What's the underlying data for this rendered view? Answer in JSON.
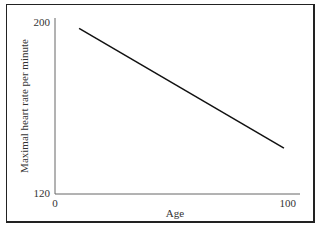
{
  "chart_data": {
    "type": "line",
    "title": "",
    "xlabel": "Age",
    "ylabel": "Maximal heart rate per minute",
    "xlim": [
      0,
      100
    ],
    "ylim": [
      120,
      200
    ],
    "x_ticks": [
      "0",
      "100"
    ],
    "y_ticks": [
      "120",
      "200"
    ],
    "grid": false,
    "legend": null,
    "series": [
      {
        "name": "Maximal heart rate",
        "x": [
          10,
          95
        ],
        "y": [
          197,
          141
        ]
      }
    ]
  },
  "axis": {
    "x_tick_min": "0",
    "x_tick_max": "100",
    "y_tick_min": "120",
    "y_tick_max": "200",
    "xlabel": "Age",
    "ylabel": "Maximal heart rate per minute"
  }
}
